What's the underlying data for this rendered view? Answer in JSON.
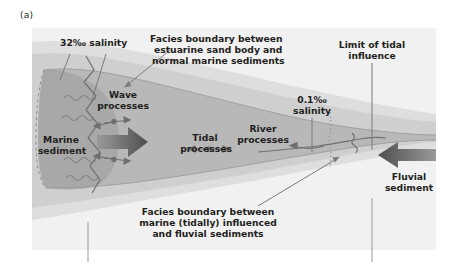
{
  "figure": {
    "panel_label": "(a)",
    "type": "estuary-facies-schematic",
    "palette": {
      "page_background": "#ffffff",
      "panel_background": "#f1f1f1",
      "outer_band": "#dcdcdc",
      "inner_band": "#cfcfcf",
      "estuary_body": "#b6b6b6",
      "marine_body": "#a9a9a9",
      "arrow_dark": "#5b5b5b",
      "arrow_mid": "#6e6e6e",
      "line_gray": "#7b7b7b",
      "text": "#231f20"
    }
  },
  "labels": {
    "salinity_left": "32‰ salinity",
    "salinity_right_line1": "0.1‰",
    "salinity_right_line2": "salinity",
    "facies_top_line1": "Facies boundary between",
    "facies_top_line2": "estuarine sand body and",
    "facies_top_line3": "normal marine sediments",
    "facies_bottom_line1": "Facies boundary between",
    "facies_bottom_line2": "marine (tidally) influenced",
    "facies_bottom_line3": "and fluvial sediments",
    "limit_tidal_line1": "Limit of tidal",
    "limit_tidal_line2": "influence",
    "wave_line1": "Wave",
    "wave_line2": "processes",
    "tidal_line1": "Tidal",
    "tidal_line2": "processes",
    "river_line1": "River",
    "river_line2": "processes",
    "marine_line1": "Marine",
    "marine_line2": "sediment",
    "fluvial_line1": "Fluvial",
    "fluvial_line2": "sediment"
  }
}
